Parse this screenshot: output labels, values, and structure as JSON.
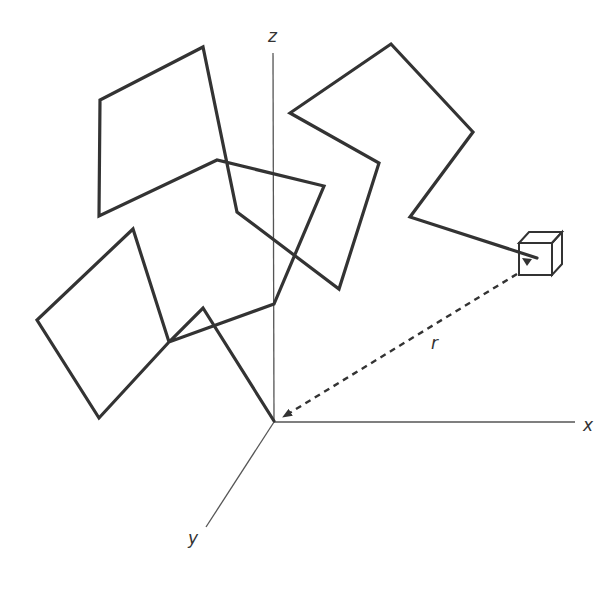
{
  "diagram": {
    "title": "",
    "colors": {
      "background": "#ffffff",
      "path": "#333333",
      "axis": "#555555",
      "vector": "#333333",
      "cube": "#333333"
    },
    "axes": {
      "origin": [
        274,
        422
      ],
      "z": {
        "label": "z",
        "end": [
          273,
          53
        ],
        "label_pos": [
          268,
          28
        ]
      },
      "x": {
        "label": "x",
        "end": [
          575,
          422
        ],
        "label_pos": [
          583,
          417
        ]
      },
      "y": {
        "label": "y",
        "end": [
          206,
          527
        ],
        "label_pos": [
          188,
          530
        ]
      }
    },
    "path": {
      "points": [
        [
          274,
          421
        ],
        [
          203,
          308
        ],
        [
          169,
          342
        ],
        [
          99,
          418
        ],
        [
          37,
          320
        ],
        [
          133,
          229
        ],
        [
          169,
          342
        ],
        [
          274,
          304
        ],
        [
          324,
          186
        ],
        [
          217,
          160
        ],
        [
          99,
          216
        ],
        [
          100,
          100
        ],
        [
          203,
          47
        ],
        [
          237,
          212
        ],
        [
          339,
          289
        ],
        [
          379,
          163
        ],
        [
          290,
          113
        ],
        [
          391,
          44
        ],
        [
          473,
          132
        ],
        [
          410,
          217
        ],
        [
          537,
          258
        ]
      ]
    },
    "cube": {
      "front": [
        519,
        243,
        33,
        32
      ],
      "depth": [
        10,
        -11
      ],
      "arrow_tip": [
        527,
        266
      ]
    },
    "vector": {
      "label": "r",
      "from": [
        517,
        274
      ],
      "to": [
        283,
        417
      ],
      "label_pos": [
        431,
        335
      ],
      "style": "dashed"
    }
  }
}
